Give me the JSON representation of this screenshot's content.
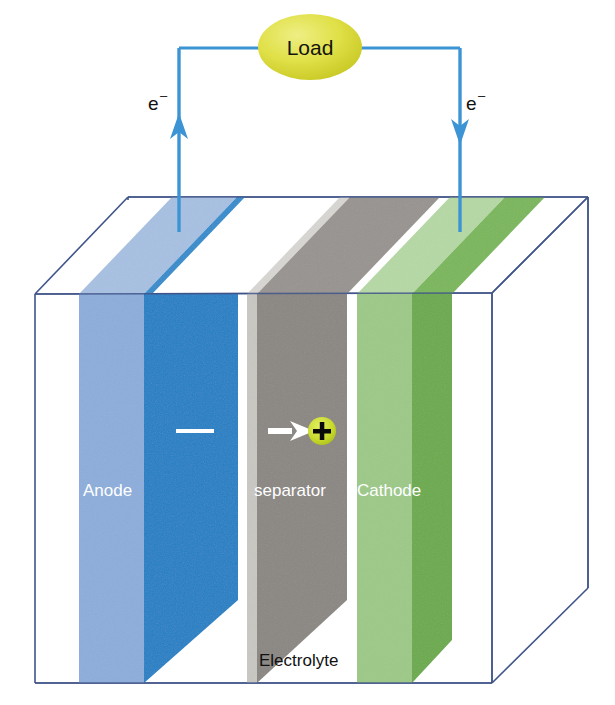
{
  "diagram": {
    "background_color": "#ffffff"
  },
  "load": {
    "label": "Load",
    "shape": "ellipse",
    "fill_color": "#d8d83a",
    "highlight_color": "#eaea72",
    "text_color": "#14140c"
  },
  "circuit": {
    "wire_color": "#3d94d4",
    "left_terminal": {
      "label": "e",
      "superscript": "–",
      "name": "electron-label-left",
      "arrow_direction": "up"
    },
    "right_terminal": {
      "label": "e",
      "superscript": "–",
      "name": "electron-label-right",
      "arrow_direction": "down"
    }
  },
  "container": {
    "label": "Electrolyte",
    "edge_color": "#3f5488",
    "fill": "none"
  },
  "plates": [
    {
      "id": "anode",
      "label": "Anode",
      "front_color": "#8caddb",
      "side_color": "#1a7fc4",
      "top_front_color": "#a7c0e2",
      "top_side_color": "#2f8bcc",
      "label_color": "#ffffff"
    },
    {
      "id": "separator",
      "label": "separator",
      "front_color": "#c9c7c2",
      "side_color": "#8a8682",
      "top_front_color": "#d8d6d2",
      "top_side_color": "#97938f",
      "label_color": "#ffffff"
    },
    {
      "id": "cathode",
      "label": "Cathode",
      "front_color": "#9cc987",
      "side_color": "#6aaa4a",
      "top_front_color": "#b5d8a4",
      "top_side_color": "#79b659",
      "label_color": "#ffffff"
    }
  ],
  "ion_flow": {
    "negative_marker": {
      "name": "minus-sign",
      "symbol": "–",
      "color": "#ffffff"
    },
    "arrow": {
      "name": "ion-flow-arrow",
      "direction": "right",
      "color": "#ffffff"
    },
    "positive_ion": {
      "name": "positive-ion",
      "symbol": "+",
      "circle_color": "#c8d92b",
      "symbol_color": "#0a0a0a"
    }
  }
}
